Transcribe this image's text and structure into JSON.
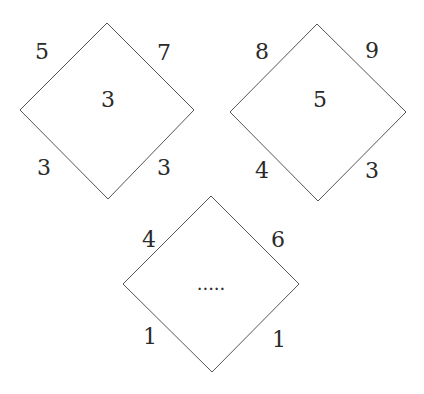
{
  "diagrams": [
    {
      "corners": {
        "top_left": "5",
        "top_right": "7",
        "bottom_left": "3",
        "bottom_right": "3"
      },
      "center": "3"
    },
    {
      "corners": {
        "top_left": "8",
        "top_right": "9",
        "bottom_left": "4",
        "bottom_right": "3"
      },
      "center": "5"
    },
    {
      "corners": {
        "top_left": "4",
        "top_right": "6",
        "bottom_left": "1",
        "bottom_right": "1"
      },
      "center": "....."
    }
  ],
  "colors": {
    "line": "#555555",
    "text": "#2a2a2a",
    "background": "#ffffff"
  }
}
